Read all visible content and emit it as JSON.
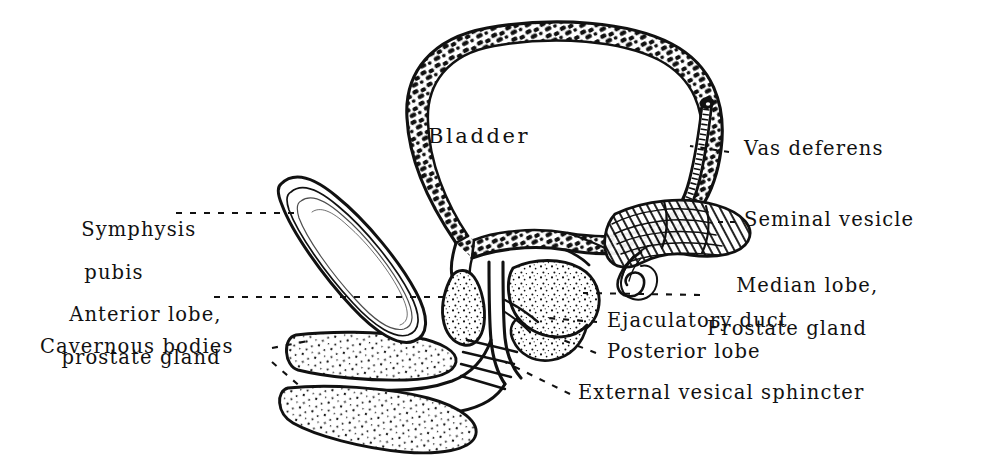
{
  "figure": {
    "style": "vintage pen-and-ink line art",
    "background_color": "#ffffff",
    "ink_color": "#111111"
  },
  "organ_labels": {
    "bladder": "Bladder"
  },
  "labels": {
    "vas_deferens": "Vas deferens",
    "seminal_vesicle": "Seminal vesicle",
    "median_lobe_l1": "Median lobe,",
    "median_lobe_l2": "Prostate gland",
    "ejaculatory_duct": "Ejaculatory duct",
    "posterior_lobe": "Posterior lobe",
    "external_vesical_sphincter": "External vesical sphincter",
    "symphysis_l1": "Symphysis",
    "symphysis_l2": "pubis",
    "anterior_lobe_l1": "Anterior lobe,",
    "anterior_lobe_l2": "prostate gland",
    "cavernous_bodies": "Cavernous bodies"
  }
}
